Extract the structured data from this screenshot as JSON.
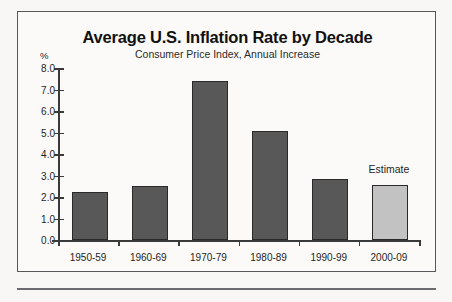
{
  "chart_data": {
    "type": "bar",
    "title": "Average U.S. Inflation Rate by Decade",
    "subtitle": "Consumer Price Index, Annual Increase",
    "xlabel": "",
    "ylabel": "%",
    "ylim": [
      0.0,
      8.0
    ],
    "ytick_labels": [
      "8.0",
      "7.0",
      "6.0",
      "5.0",
      "4.0",
      "3.0",
      "2.0",
      "1.0",
      "0.0"
    ],
    "ytick_values": [
      8.0,
      7.0,
      6.0,
      5.0,
      4.0,
      3.0,
      2.0,
      1.0,
      0.0
    ],
    "grid": false,
    "legend": "none",
    "categories": [
      "1950-59",
      "1960-69",
      "1970-79",
      "1980-89",
      "1990-99",
      "2000-09"
    ],
    "values": [
      2.25,
      2.5,
      7.4,
      5.05,
      2.85,
      2.55
    ],
    "bar_colors": [
      "#585858",
      "#585858",
      "#585858",
      "#585858",
      "#585858",
      "#c2c2c2"
    ],
    "annotations": [
      {
        "text": "Estimate",
        "category": "2000-09"
      }
    ],
    "colors": {
      "bar_dark": "#585858",
      "bar_light": "#c2c2c2",
      "bar_outline": "#2a2a2a",
      "axis": "#3a3a3a",
      "frame": "#58585a",
      "background": "#fbfaf8",
      "text": "#1f1f1f"
    }
  }
}
